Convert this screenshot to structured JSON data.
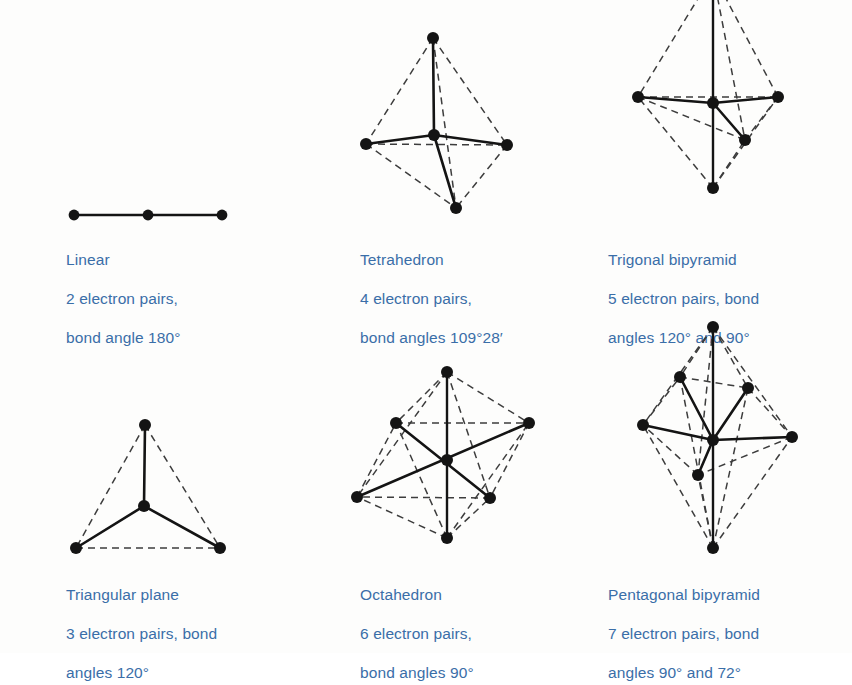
{
  "page": {
    "text_color": "#3a6ea8",
    "line_color": "#141414",
    "background": "#fdfdfc"
  },
  "figures": [
    {
      "id": "linear",
      "shape": "linear",
      "name": "Linear",
      "line1": "Linear",
      "line2": "2 electron pairs,",
      "line3": "bond angle 180°",
      "electron_pairs": 2,
      "bond_angles": [
        "180°"
      ],
      "vertices": 3,
      "caption_x": 66,
      "caption_y": 230
    },
    {
      "id": "tetrahedron",
      "shape": "tetrahedron",
      "name": "Tetrahedron",
      "line1": "Tetrahedron",
      "line2": "4 electron pairs,",
      "line3": "bond angles 109°28′",
      "electron_pairs": 4,
      "bond_angles": [
        "109°28′"
      ],
      "vertices": 5,
      "caption_x": 360,
      "caption_y": 230
    },
    {
      "id": "trigonal-bipyramid",
      "shape": "trigonal-bipyramid",
      "name": "Trigonal bipyramid",
      "line1": "Trigonal bipyramid",
      "line2": "5 electron pairs, bond",
      "line3": "angles 120° and 90°",
      "electron_pairs": 5,
      "bond_angles": [
        "120°",
        "90°"
      ],
      "vertices": 6,
      "caption_x": 608,
      "caption_y": 230
    },
    {
      "id": "triangular-plane",
      "shape": "triangular-plane",
      "name": "Triangular plane",
      "line1": "Triangular plane",
      "line2": "3 electron pairs, bond",
      "line3": "angles 120°",
      "electron_pairs": 3,
      "bond_angles": [
        "120°"
      ],
      "vertices": 4,
      "caption_x": 66,
      "caption_y": 565
    },
    {
      "id": "octahedron",
      "shape": "octahedron",
      "name": "Octahedron",
      "line1": "Octahedron",
      "line2": "6 electron pairs,",
      "line3": "bond angles 90°",
      "electron_pairs": 6,
      "bond_angles": [
        "90°"
      ],
      "vertices": 7,
      "caption_x": 360,
      "caption_y": 565
    },
    {
      "id": "pentagonal-bipyramid",
      "shape": "pentagonal-bipyramid",
      "name": "Pentagonal bipyramid",
      "line1": "Pentagonal bipyramid",
      "line2": "7 electron pairs, bond",
      "line3": "angles 90° and 72°",
      "electron_pairs": 7,
      "bond_angles": [
        "90°",
        "72°"
      ],
      "vertices": 8,
      "caption_x": 608,
      "caption_y": 565
    }
  ]
}
